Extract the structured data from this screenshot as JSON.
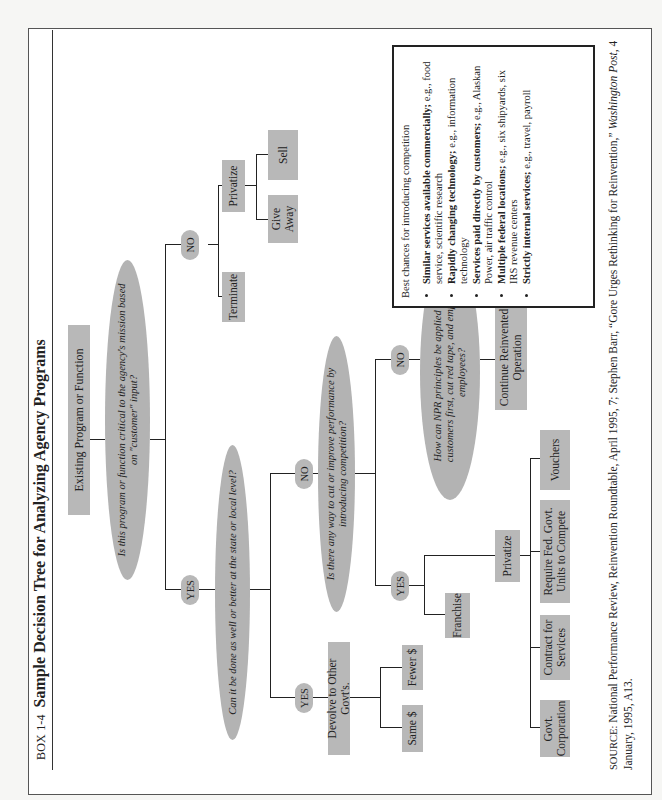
{
  "title": {
    "box_label": "BOX 1-4",
    "main": "Sample Decision Tree for Analyzing Agency Programs"
  },
  "nodes": {
    "root": "Existing Program or Function",
    "q1": "Is this program or function critical to the agency's mission based on \"customer\" input?",
    "q1_no": "NO",
    "q1_yes": "YES",
    "terminate": "Terminate",
    "privatize_a": "Privatize",
    "sell": "Sell",
    "give_away": "Give Away",
    "q2": "Can it be done as well or better at the state or local level?",
    "q2_yes": "YES",
    "q2_no": "NO",
    "devolve": "Devolve to Other Govt's.",
    "fewer": "Fewer $",
    "same": "Same $",
    "q3": "Is there any way to cut or improve performance by introducing competition?",
    "q3_yes": "YES",
    "q3_no": "NO",
    "franchise": "Franchise",
    "privatize_b": "Privatize",
    "gov_corp": "Govt. Corporation",
    "contract": "Contract for Services",
    "require": "Require Fed. Govt. Units to Compete",
    "vouchers": "Vouchers",
    "q4": "How can NPR principles be applied to put customers first, cut red tape, and empower employees?",
    "continue": "Continue Reinvented Operation"
  },
  "info_box": {
    "heading": "Best chances for introducing competition",
    "items": [
      {
        "bold": "Similar services available commercially;",
        "rest": " e.g., food service, scientific research"
      },
      {
        "bold": "Rapidly changing technology;",
        "rest": " e.g., information technology"
      },
      {
        "bold": "Services paid directly by customers;",
        "rest": " e.g., Alaskan Power, air traffic control"
      },
      {
        "bold": "Multiple federal locations;",
        "rest": " e.g., six shipyards, six IRS revenue centers"
      },
      {
        "bold": "Strictly internal services;",
        "rest": " e.g., travel, payroll"
      }
    ]
  },
  "source": {
    "label": "SOURCE:",
    "text_a": " National Performance Review, Reinvention Roundtable, April 1995, 7; Stephen Barr, “Gore Urges Rethinking for Reinvention,” ",
    "publication": "Washington Post,",
    "text_b": " 4 January, 1995, A13."
  }
}
